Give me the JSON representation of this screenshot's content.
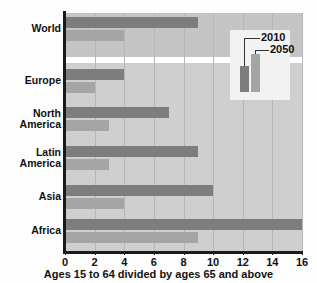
{
  "chart_data": {
    "type": "bar",
    "orientation": "horizontal",
    "title": "",
    "xlabel": "Ages 15 to 64 divided by ages 65 and above",
    "ylabel": "",
    "xlim": [
      0,
      16
    ],
    "xticks": [
      0,
      2,
      4,
      6,
      8,
      10,
      12,
      14,
      16
    ],
    "grid": true,
    "legend_position": "upper-right",
    "categories": [
      "World",
      "Europe",
      "North America",
      "Latin America",
      "Asia",
      "Africa"
    ],
    "series": [
      {
        "name": "2010",
        "color": "#7d7d7d",
        "values": [
          9,
          4,
          7,
          9,
          10,
          16
        ]
      },
      {
        "name": "2050",
        "color": "#a5a5a5",
        "values": [
          4,
          2,
          3,
          3,
          4,
          9
        ]
      }
    ]
  },
  "legend": {
    "entries": [
      {
        "label": "2010"
      },
      {
        "label": "2050"
      }
    ]
  },
  "colors": {
    "series_2010": "#7d7d7d",
    "series_2050": "#a5a5a5",
    "plot_background": "#c9c9c9",
    "axis": "#1a1a1a"
  }
}
